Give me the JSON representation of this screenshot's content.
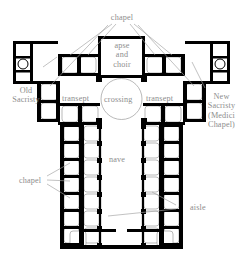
{
  "figure": {
    "kind": "architectural-floor-plan",
    "width": 243,
    "height": 260,
    "background_color": "#ffffff",
    "wall_color": "#000000",
    "vault_line_color": "#9b9b9b",
    "label_color": "#8d8d8d"
  },
  "labels": {
    "chapel_top": "chapel",
    "apse_and_choir": "apse\nand\nchoir",
    "apse_line1": "apse",
    "apse_line2": "and",
    "apse_line3": "choir",
    "transept_left": "transept",
    "transept_right": "transept",
    "crossing": "crossing",
    "old_sacristy_line1": "Old",
    "old_sacristy_line2": "Sacristy",
    "new_sacristy_line1": "New",
    "new_sacristy_line2": "Sacristy",
    "new_sacristy_line3": "(Medici",
    "new_sacristy_line4": "Chapel)",
    "nave": "nave",
    "chapel_left": "chapel",
    "aisle": "aisle"
  },
  "plan_parts": [
    {
      "name": "apse-and-choir",
      "label": "apse and choir"
    },
    {
      "name": "crossing",
      "label": "crossing"
    },
    {
      "name": "left-transept",
      "label": "transept"
    },
    {
      "name": "right-transept",
      "label": "transept"
    },
    {
      "name": "nave",
      "label": "nave"
    },
    {
      "name": "left-aisle",
      "label": "aisle"
    },
    {
      "name": "right-aisle",
      "label": "aisle"
    },
    {
      "name": "old-sacristy",
      "label": "Old Sacristy"
    },
    {
      "name": "new-sacristy",
      "label": "New Sacristy (Medici Chapel)"
    },
    {
      "name": "side-chapels",
      "label": "chapel"
    }
  ],
  "counts": {
    "nave_chapel_bays_per_side": 7,
    "nave_aisle_bays_per_side": 7,
    "transept_chapels_top": 4,
    "transept_chapels_side": 2
  }
}
